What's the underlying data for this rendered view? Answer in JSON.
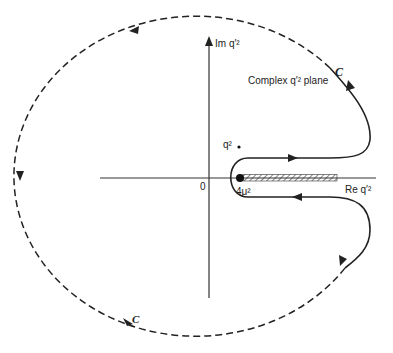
{
  "diagram": {
    "plane_label": "Complex q′² plane",
    "axes": {
      "imaginary_label": "Im q′²",
      "real_label": "Re q′²",
      "origin_label": "0"
    },
    "points": {
      "pole_label": "q²",
      "branch_point_label": "4μ²"
    },
    "contour": {
      "label_top": "C",
      "label_bottom": "C"
    },
    "colors": {
      "line": "#222222",
      "background": "#ffffff"
    }
  }
}
